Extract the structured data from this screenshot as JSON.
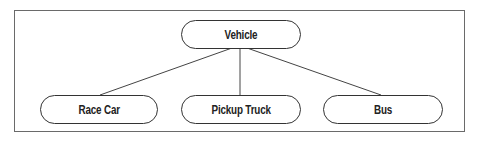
{
  "diagram": {
    "type": "tree",
    "root": {
      "label": "Vehicle"
    },
    "children": [
      {
        "label": "Race Car"
      },
      {
        "label": "Pickup Truck"
      },
      {
        "label": "Bus"
      }
    ]
  },
  "colors": {
    "frame_border": "#6a6a6a",
    "node_border": "#333333",
    "line": "#444444",
    "text": "#222222",
    "background": "#ffffff"
  }
}
